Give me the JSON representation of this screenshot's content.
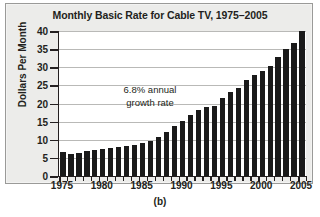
{
  "chart_data": {
    "type": "bar",
    "title": "Monthly Basic Rate for Cable TV, 1975–2005",
    "xlabel": "",
    "ylabel": "Dollars Per Month",
    "ylim": [
      0,
      40
    ],
    "ytick_values": [
      0,
      5,
      10,
      15,
      20,
      25,
      30,
      35,
      40
    ],
    "ytick_labels": [
      "0",
      "5",
      "10",
      "15",
      "20",
      "25",
      "30",
      "35",
      "40"
    ],
    "xtick_labels": [
      "1975",
      "1980",
      "1985",
      "1990",
      "1995",
      "2000",
      "2005"
    ],
    "xtick_values": [
      1975,
      1980,
      1985,
      1990,
      1995,
      2000,
      2005
    ],
    "grid": "horizontal",
    "legend": "none",
    "bar_color": "#1a1a1a",
    "categories": [
      1975,
      1976,
      1977,
      1978,
      1979,
      1980,
      1981,
      1982,
      1983,
      1984,
      1985,
      1986,
      1987,
      1988,
      1989,
      1990,
      1991,
      1992,
      1993,
      1994,
      1995,
      1996,
      1997,
      1998,
      1999,
      2000,
      2001,
      2002,
      2003,
      2004,
      2005
    ],
    "values": [
      6.6,
      6.2,
      6.4,
      6.8,
      7.1,
      7.5,
      7.7,
      7.9,
      8.2,
      8.6,
      9.2,
      9.7,
      10.7,
      12.1,
      13.9,
      15.2,
      16.8,
      18.1,
      19.1,
      19.4,
      21.6,
      23.2,
      24.4,
      26.5,
      27.9,
      28.9,
      30.4,
      32.8,
      35.0,
      36.8,
      38.1
    ],
    "last_bar_value": 40.0,
    "annotation": {
      "line1": "6.8% annual",
      "line2": "growth rate"
    }
  },
  "caption": "(b)"
}
